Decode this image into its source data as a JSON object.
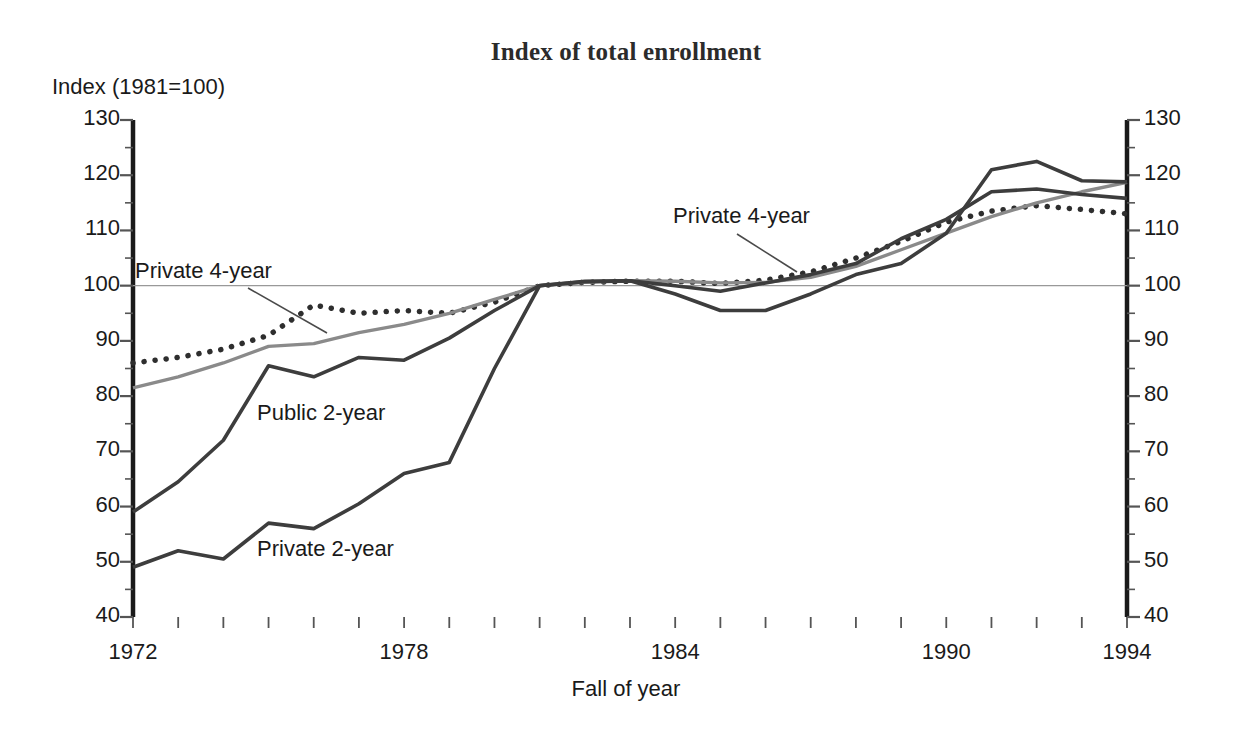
{
  "chart_data": {
    "type": "line",
    "title": "Index of total enrollment",
    "ylabel": "Index (1981=100)",
    "xlabel": "Fall of year",
    "grid": false,
    "reference_line": 100,
    "legend_position": "inline-annotations",
    "xlim": [
      1972,
      1994
    ],
    "ylim": [
      40,
      130
    ],
    "y_major_step": 10,
    "y_minor_step": 5,
    "x_major_step": 6,
    "x_minor_step": 1,
    "x": [
      1972,
      1973,
      1974,
      1975,
      1976,
      1977,
      1978,
      1979,
      1980,
      1981,
      1982,
      1983,
      1984,
      1985,
      1986,
      1987,
      1988,
      1989,
      1990,
      1991,
      1992,
      1993,
      1994
    ],
    "y_ticks": [
      40,
      50,
      60,
      70,
      80,
      90,
      100,
      110,
      120,
      130
    ],
    "x_ticks": [
      1972,
      1978,
      1984,
      1990,
      1994
    ],
    "x_tick_labels": [
      "1972",
      "1978",
      "1984",
      "1990",
      "1994"
    ],
    "y_tick_labels": [
      "40",
      "50",
      "60",
      "70",
      "80",
      "90",
      "100",
      "110",
      "120",
      "130"
    ],
    "series": [
      {
        "name": "Private 4-year",
        "style": "dotted",
        "color": "#2e2e2e",
        "values": [
          86.0,
          87.0,
          88.5,
          91.0,
          96.5,
          95.0,
          95.5,
          95.0,
          97.0,
          100.0,
          100.6,
          100.8,
          100.8,
          100.4,
          101.0,
          102.5,
          105.0,
          108.0,
          111.5,
          113.5,
          114.5,
          113.8,
          113.0
        ]
      },
      {
        "name": "Public 4-year",
        "style": "solid-light",
        "color": "#8a8a8a",
        "values": [
          81.5,
          83.5,
          86.0,
          89.0,
          89.5,
          91.5,
          93.0,
          95.0,
          97.5,
          100.0,
          100.6,
          100.9,
          100.8,
          100.5,
          100.6,
          101.5,
          103.5,
          106.5,
          109.5,
          112.5,
          115.0,
          117.0,
          118.7
        ]
      },
      {
        "name": "Public 2-year",
        "style": "solid-dark",
        "color": "#3d3d3d",
        "values": [
          59.0,
          64.5,
          72.0,
          85.5,
          83.5,
          87.0,
          86.5,
          90.5,
          95.5,
          100.0,
          100.8,
          100.9,
          100.0,
          99.0,
          100.5,
          102.0,
          104.0,
          108.5,
          112.0,
          117.0,
          117.5,
          116.5,
          115.8
        ]
      },
      {
        "name": "Private 2-year",
        "style": "solid-dark",
        "color": "#3d3d3d",
        "values": [
          49.0,
          52.0,
          50.5,
          57.0,
          56.0,
          60.5,
          66.0,
          68.0,
          85.0,
          100.0,
          100.7,
          100.9,
          98.5,
          95.5,
          95.5,
          98.5,
          102.0,
          104.0,
          109.5,
          121.0,
          122.5,
          119.0,
          118.8
        ]
      }
    ],
    "annotations": [
      {
        "id": "label-private-4year-left",
        "text": "Private 4-year",
        "target_series": "Private 4-year"
      },
      {
        "id": "label-private-4year-right",
        "text": "Private 4-year",
        "target_series": "Private 4-year"
      },
      {
        "id": "label-public-2year",
        "text": "Public 2-year",
        "target_series": "Public 2-year"
      },
      {
        "id": "label-private-2year",
        "text": "Private 2-year",
        "target_series": "Private 2-year"
      }
    ]
  }
}
